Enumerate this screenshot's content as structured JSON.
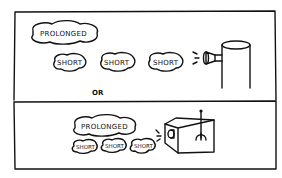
{
  "diagram": {
    "top_panel": {
      "prolonged_label": "PROLONGED",
      "short_labels": [
        "SHORT",
        "SHORT",
        "SHORT"
      ],
      "source_icon": "cylinder-nozzle-icon"
    },
    "separator_label": "OR",
    "bottom_panel": {
      "prolonged_label": "PROLONGED",
      "short_labels": [
        "SHORT",
        "SHORT",
        "SHORT"
      ],
      "source_icon": "box-lever-icon"
    },
    "colors": {
      "ink": "#111111",
      "background": "#ffffff"
    }
  }
}
